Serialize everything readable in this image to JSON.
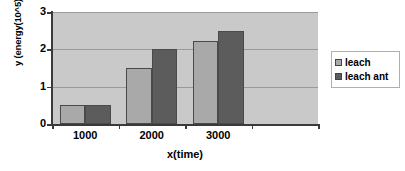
{
  "chart_data": {
    "type": "bar",
    "title": "",
    "xlabel": "x(time)",
    "ylabel": "y (energy(10^5))",
    "categories": [
      "1000",
      "2000",
      "3000",
      ""
    ],
    "series": [
      {
        "name": "leach",
        "values": [
          0.5,
          1.5,
          2.22,
          null
        ],
        "color": "#a9a9a9"
      },
      {
        "name": "leach ant",
        "values": [
          0.5,
          2.0,
          2.48,
          null
        ],
        "color": "#5c5c5c"
      }
    ],
    "ylim": [
      0,
      3
    ],
    "yticks": [
      "0",
      "1",
      "2",
      "3"
    ],
    "ytick_values": [
      0,
      1,
      2,
      3
    ],
    "grid": true,
    "legend_position": "right",
    "plot_background": "#c9c9c9"
  },
  "legend": {
    "entries": [
      {
        "label": "leach"
      },
      {
        "label": "leach ant"
      }
    ]
  }
}
